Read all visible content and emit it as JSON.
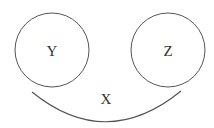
{
  "diagram": {
    "nodes": [
      {
        "id": "Y",
        "label": "Y",
        "shape": "circle",
        "cx": 52,
        "cy": 50,
        "r": 37
      },
      {
        "id": "Z",
        "label": "Z",
        "shape": "circle",
        "cx": 168,
        "cy": 50,
        "r": 37
      }
    ],
    "edges": [
      {
        "id": "X",
        "label": "X",
        "shape": "arc",
        "from": "Y",
        "to": "Z",
        "undirected": true
      }
    ],
    "colors": {
      "stroke": "#555555",
      "text": "#333333",
      "background": "#ffffff"
    }
  }
}
